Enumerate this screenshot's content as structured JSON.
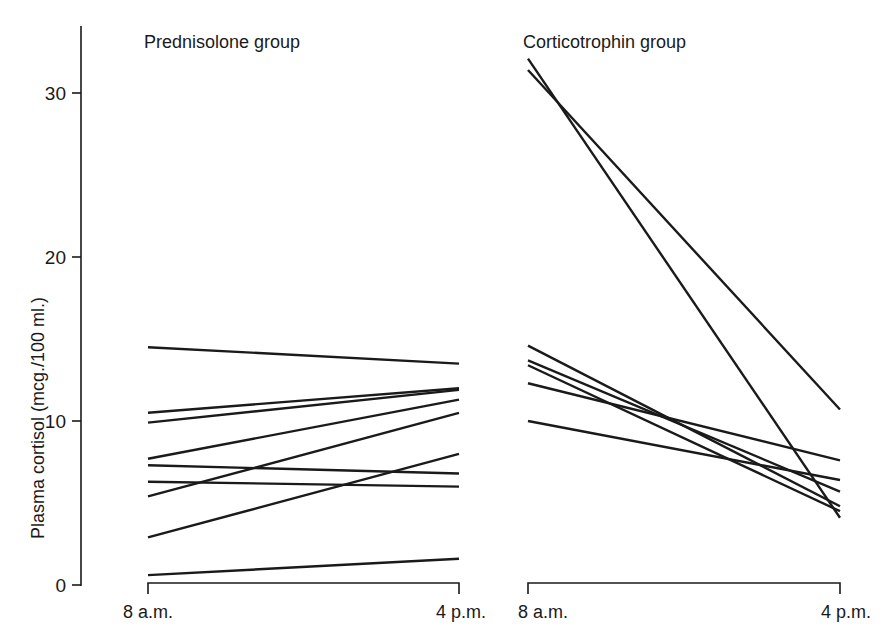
{
  "chart_data": {
    "type": "line",
    "title": "",
    "ylabel": "Plasma cortisol (mcg./100 ml.)",
    "xlabel": "",
    "ylim": [
      0,
      34
    ],
    "yticks": [
      0,
      10,
      20,
      30
    ],
    "grid": false,
    "panels": [
      {
        "title": "Prednisolone group",
        "x": [
          "8 a.m.",
          "4 p.m."
        ],
        "series": [
          {
            "name": "patient 1",
            "values": [
              14.5,
              13.5
            ]
          },
          {
            "name": "patient 2",
            "values": [
              10.5,
              12.0
            ]
          },
          {
            "name": "patient 3",
            "values": [
              9.9,
              11.9
            ]
          },
          {
            "name": "patient 4",
            "values": [
              7.7,
              11.3
            ]
          },
          {
            "name": "patient 5",
            "values": [
              7.3,
              6.8
            ]
          },
          {
            "name": "patient 6",
            "values": [
              6.3,
              6.0
            ]
          },
          {
            "name": "patient 7",
            "values": [
              5.4,
              10.5
            ]
          },
          {
            "name": "patient 8",
            "values": [
              2.9,
              8.0
            ]
          },
          {
            "name": "patient 9",
            "values": [
              0.6,
              1.6
            ]
          }
        ]
      },
      {
        "title": "Corticotrophin group",
        "x": [
          "8 a.m.",
          "4 p.m."
        ],
        "series": [
          {
            "name": "patient 1",
            "values": [
              32.1,
              4.1
            ]
          },
          {
            "name": "patient 2",
            "values": [
              31.4,
              10.7
            ]
          },
          {
            "name": "patient 3",
            "values": [
              14.6,
              4.8
            ]
          },
          {
            "name": "patient 4",
            "values": [
              13.7,
              5.7
            ]
          },
          {
            "name": "patient 5",
            "values": [
              13.4,
              4.5
            ]
          },
          {
            "name": "patient 6",
            "values": [
              12.3,
              7.6
            ]
          },
          {
            "name": "patient 7",
            "values": [
              10.0,
              6.4
            ]
          }
        ]
      }
    ]
  },
  "labels": {
    "ylabel": "Plasma cortisol (mcg./100 ml.)",
    "ytick_0": "0",
    "ytick_10": "10",
    "ytick_20": "20",
    "ytick_30": "30",
    "panel_left_title": "Prednisolone group",
    "panel_right_title": "Corticotrophin group",
    "left_x_start": "8 a.m.",
    "left_x_end": "4 p.m.",
    "right_x_start": "8 a.m.",
    "right_x_end": "4 p.m."
  },
  "colors": {
    "ink": "#1a1a1a",
    "background": "#ffffff"
  }
}
